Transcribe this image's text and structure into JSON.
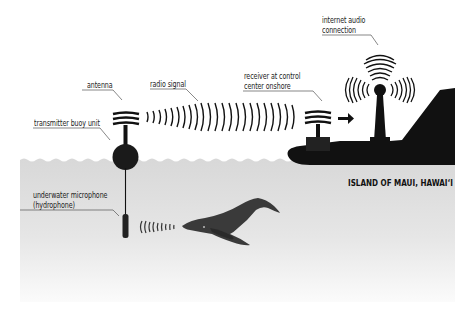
{
  "diagram": {
    "labels": {
      "antenna": "antenna",
      "radio_signal": "radio signal",
      "transmitter": "transmitter buoy unit",
      "receiver_line1": "receiver at control",
      "receiver_line2": "center onshore",
      "internet_line1": "internet audio",
      "internet_line2": "connection",
      "hydrophone_line1": "underwater microphone",
      "hydrophone_line2": "(hydrophone)",
      "island": "ISLAND OF MAUI, HAWAI‘I"
    },
    "components": [
      {
        "id": "buoy",
        "icon": "buoy-icon"
      },
      {
        "id": "antenna",
        "icon": "antenna-icon"
      },
      {
        "id": "radio-waves",
        "icon": "radio-waves-icon"
      },
      {
        "id": "receiver",
        "icon": "receiver-antenna-icon"
      },
      {
        "id": "arrow",
        "icon": "arrow-right-icon"
      },
      {
        "id": "broadcast-tower",
        "icon": "broadcast-tower-icon"
      },
      {
        "id": "island",
        "icon": "island-silhouette-icon"
      },
      {
        "id": "hydrophone",
        "icon": "hydrophone-icon"
      },
      {
        "id": "sound-waves",
        "icon": "sound-waves-icon"
      },
      {
        "id": "whale",
        "icon": "humpback-whale-icon"
      }
    ],
    "colors": {
      "ink": "#111111",
      "water": "#d9d9d9",
      "water_fade": "#f4f4f4",
      "whale": "#3a3a3a",
      "leader": "#555555"
    }
  }
}
